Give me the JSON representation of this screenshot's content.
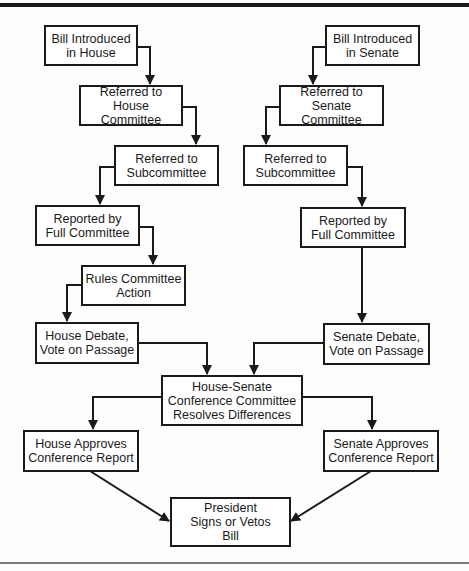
{
  "diagram": {
    "nodes": {
      "house_intro": "Bill Introduced\nin House",
      "house_committee": "Referred to\nHouse Committee",
      "house_subcommittee": "Referred to\nSubcommittee",
      "house_full_committee": "Reported by\nFull Committee",
      "rules_committee": "Rules Committee\nAction",
      "house_debate": "House Debate,\nVote on Passage",
      "senate_intro": "Bill Introduced\nin Senate",
      "senate_committee": "Referred to\nSenate Committee",
      "senate_subcommittee": "Referred to\nSubcommittee",
      "senate_full_committee": "Reported by\nFull Committee",
      "senate_debate": "Senate Debate,\nVote on Passage",
      "conference": "House-Senate\nConference Committee\nResolves Differences",
      "house_approves": "House Approves\nConference Report",
      "senate_approves": "Senate Approves\nConference Report",
      "president": "President\nSigns or Vetos\nBill"
    },
    "edges": [
      [
        "house_intro",
        "house_committee"
      ],
      [
        "house_committee",
        "house_subcommittee"
      ],
      [
        "house_subcommittee",
        "house_full_committee"
      ],
      [
        "house_full_committee",
        "rules_committee"
      ],
      [
        "rules_committee",
        "house_debate"
      ],
      [
        "house_debate",
        "conference"
      ],
      [
        "senate_intro",
        "senate_committee"
      ],
      [
        "senate_committee",
        "senate_subcommittee"
      ],
      [
        "senate_subcommittee",
        "senate_full_committee"
      ],
      [
        "senate_full_committee",
        "senate_debate"
      ],
      [
        "senate_debate",
        "conference"
      ],
      [
        "conference",
        "house_approves"
      ],
      [
        "conference",
        "senate_approves"
      ],
      [
        "house_approves",
        "president"
      ],
      [
        "senate_approves",
        "president"
      ]
    ]
  }
}
